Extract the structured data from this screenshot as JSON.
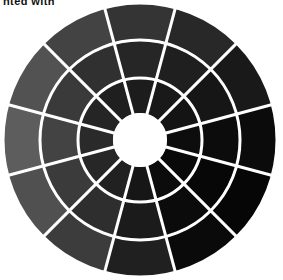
{
  "caption": {
    "text": "nted with",
    "note": "clipped-top-partial-text"
  },
  "figure": {
    "background_color": "#ffffff",
    "separator_color": "#ffffff",
    "hub_color": "#ffffff"
  },
  "chart_data": {
    "type": "pie",
    "subtitle": "",
    "xlabel": "",
    "ylabel": "",
    "legend_position": "none",
    "grid": false,
    "center_x": 140,
    "center_y": 140,
    "outer_radius": 137,
    "hub_radius": 27,
    "ring_count": 4,
    "sector_count": 12,
    "sector_angle_deg": 30,
    "start_angle_deg": -105,
    "separator_width": 3,
    "ring_radii": [
      27,
      62,
      100,
      137
    ],
    "ring_labels": [
      "ring-1-inner",
      "ring-2",
      "ring-3",
      "ring-4-outer"
    ],
    "sector_labels": [
      "sector-1",
      "sector-2",
      "sector-3",
      "sector-4",
      "sector-5",
      "sector-6",
      "sector-7",
      "sector-8",
      "sector-9",
      "sector-10",
      "sector-11",
      "sector-12"
    ],
    "series": [
      {
        "name": "ring-1-inner",
        "values": [
          "#1c1c1c",
          "#191919",
          "#141414",
          "#0d0d0d",
          "#090909",
          "#0c0c0c",
          "#161616",
          "#212121",
          "#272727",
          "#2a2a2a",
          "#252525",
          "#1f1f1f"
        ]
      },
      {
        "name": "ring-2",
        "values": [
          "#262626",
          "#1f1f1f",
          "#161616",
          "#0c0c0c",
          "#070707",
          "#0b0b0b",
          "#1b1b1b",
          "#2e2e2e",
          "#3b3b3b",
          "#434343",
          "#3a3a3a",
          "#303030"
        ]
      },
      {
        "name": "ring-3",
        "values": [
          "#343434",
          "#282828",
          "#191919",
          "#0b0b0b",
          "#060606",
          "#0a0a0a",
          "#202020",
          "#3c3c3c",
          "#505050",
          "#5d5d5d",
          "#525252",
          "#434343"
        ]
      },
      {
        "name": "ring-4-outer",
        "values": [
          "#3e3e3e",
          "#2e2e2e",
          "#1b1b1b",
          "#0a0a0a",
          "#050505",
          "#0a0a0a",
          "#242424",
          "#474747",
          "#646464",
          "#7b7b7b",
          "#6b6b6b",
          "#565656"
        ]
      }
    ]
  }
}
